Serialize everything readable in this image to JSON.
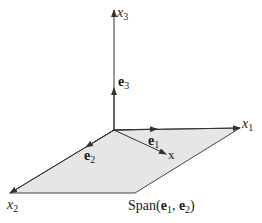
{
  "diagram": {
    "axes": {
      "x1": {
        "var": "x",
        "sub": "1"
      },
      "x2": {
        "var": "x",
        "sub": "2"
      },
      "x3": {
        "var": "x",
        "sub": "3"
      }
    },
    "vectors": {
      "e1": {
        "name": "e",
        "sub": "1"
      },
      "e2": {
        "name": "e",
        "sub": "2"
      },
      "e3": {
        "name": "e",
        "sub": "3"
      },
      "x": {
        "name": "x"
      }
    },
    "plane_label": {
      "prefix": "Span",
      "open": "(",
      "v1": "e",
      "v1_sub": "1",
      "comma": ", ",
      "v2": "e",
      "v2_sub": "2",
      "close": ")"
    },
    "colors": {
      "plane_fill": "#e6e6e6",
      "line": "#333333",
      "text": "#1a1a1a"
    }
  }
}
